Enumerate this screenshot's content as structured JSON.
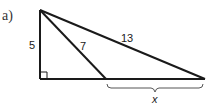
{
  "part_label": "a)",
  "diagram": {
    "type": "right-triangle",
    "labels": {
      "vertical_leg": "5",
      "inner_segment": "7",
      "hypotenuse": "13",
      "unknown_base": "x"
    },
    "right_angle_marker": true,
    "brace_under": "unknown_base"
  }
}
